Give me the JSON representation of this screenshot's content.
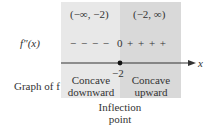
{
  "intervals": {
    "left": "(−∞, −2)",
    "right": "(−2, ∞)"
  },
  "row_labels": {
    "second_derivative": "f″(x)",
    "graph": "Graph of f"
  },
  "sign_chart": {
    "left_signs": "− − − −",
    "zero": "0",
    "right_signs": "+ + + +"
  },
  "axis": {
    "variable": "x",
    "critical_value": "−2"
  },
  "concavity": {
    "left_line1": "Concave",
    "left_line2": "downward",
    "right_line1": "Concave",
    "right_line2": "upward"
  },
  "annotation": {
    "line1": "Inflection",
    "line2": "point"
  },
  "colors": {
    "left_region": "#e8e8e8",
    "right_region": "#d9d9d9",
    "axis": "#333333"
  }
}
